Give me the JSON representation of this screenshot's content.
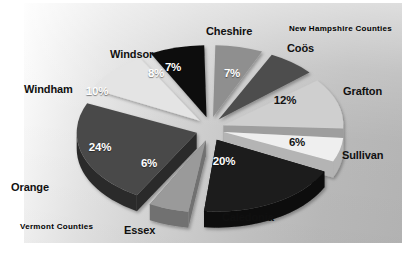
{
  "chart_data": {
    "type": "pie",
    "title": "",
    "subtitle": "",
    "xlabel": "",
    "ylabel": "",
    "legend_position": "none",
    "grid": false,
    "exploded": true,
    "three_d": true,
    "value_suffix": "%",
    "total": 100,
    "categories": [
      "Cheshire",
      "Coös",
      "Grafton",
      "Sullivan",
      "Caledonia",
      "Essex",
      "Orange",
      "Windham",
      "Windsor"
    ],
    "values": [
      7,
      7,
      12,
      6,
      20,
      6,
      24,
      10,
      8
    ],
    "value_labels": [
      "7%",
      "7%",
      "12%",
      "6%",
      "20%",
      "6%",
      "24%",
      "10%",
      "8%"
    ],
    "colors": [
      "#8f8f8f",
      "#4e4e4e",
      "#cfcfcf",
      "#efefef",
      "#1c1c1c",
      "#9a9a9a",
      "#4a4a4a",
      "#e4e4e4",
      "#0d0d0d"
    ],
    "slices": [
      {
        "label": "Cheshire",
        "value": 7,
        "value_label": "7%",
        "color": "#8f8f8f",
        "side_color": "#6f6f6f",
        "group": "New Hampshire Counties"
      },
      {
        "label": "Coös",
        "value": 7,
        "value_label": "7%",
        "color": "#4e4e4e",
        "side_color": "#2f2f2f",
        "group": "New Hampshire Counties"
      },
      {
        "label": "Grafton",
        "value": 12,
        "value_label": "12%",
        "color": "#cfcfcf",
        "side_color": "#9e9e9e",
        "group": "New Hampshire Counties"
      },
      {
        "label": "Sullivan",
        "value": 6,
        "value_label": "6%",
        "color": "#efefef",
        "side_color": "#b4b4b4",
        "group": "New Hampshire Counties"
      },
      {
        "label": "Caledonia",
        "value": 20,
        "value_label": "20%",
        "color": "#1c1c1c",
        "side_color": "#0a0a0a",
        "group": "Vermont Counties"
      },
      {
        "label": "Essex",
        "value": 6,
        "value_label": "6%",
        "color": "#9a9a9a",
        "side_color": "#717171",
        "group": "Vermont Counties"
      },
      {
        "label": "Orange",
        "value": 24,
        "value_label": "24%",
        "color": "#4a4a4a",
        "side_color": "#2c2c2c",
        "group": "Vermont Counties"
      },
      {
        "label": "Windham",
        "value": 10,
        "value_label": "10%",
        "color": "#e4e4e4",
        "side_color": "#adadad",
        "group": "Vermont Counties"
      },
      {
        "label": "Windsor",
        "value": 8,
        "value_label": "8%",
        "color": "#0d0d0d",
        "side_color": "#040404",
        "group": "Vermont Counties"
      }
    ],
    "annotations": [
      {
        "name": "new-hampshire-counties",
        "text": "New Hampshire Counties",
        "color": "#7c8b8b",
        "position": "top-right"
      },
      {
        "name": "vermont-counties",
        "text": "Vermont Counties",
        "color": "#7c8b8b",
        "position": "bottom-left"
      }
    ]
  },
  "figure": {
    "background": "#ffffff",
    "plate_gradient_from": "#fdfdfd",
    "plate_gradient_to": "#b4b4b4",
    "label_color": "#101010",
    "value_color": "#ffffff"
  },
  "groups": {
    "new_hampshire": "New Hampshire Counties",
    "vermont": "Vermont Counties"
  },
  "labels": {
    "cheshire": "Cheshire",
    "coos": "Coös",
    "grafton": "Grafton",
    "sullivan": "Sullivan",
    "caledonia": "Caledonia",
    "essex": "Essex",
    "orange": "Orange",
    "windham": "Windham",
    "windsor": "Windsor"
  },
  "values": {
    "cheshire": "7%",
    "coos": "7%",
    "grafton": "12%",
    "sullivan": "6%",
    "caledonia": "20%",
    "essex": "6%",
    "orange": "24%",
    "windham": "10%",
    "windsor": "8%"
  }
}
